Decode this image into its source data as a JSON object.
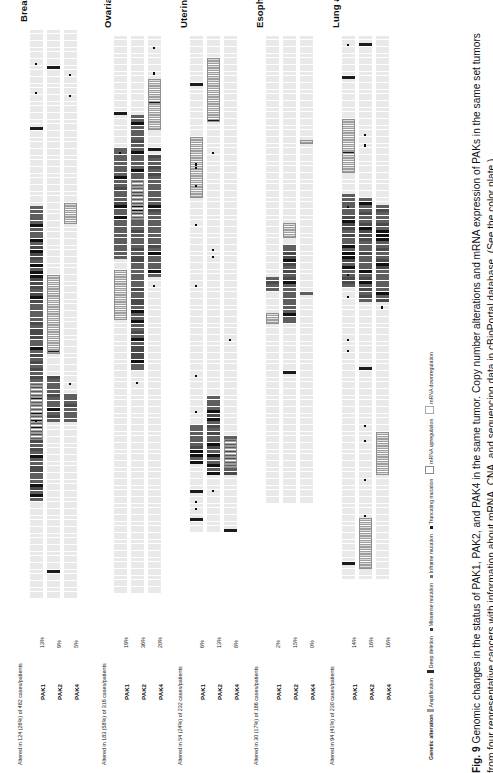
{
  "figure": {
    "number": "Fig. 9",
    "caption_text": "Genomic changes in the status of PAK1, PAK2, and PAK4 in the same tumor. Copy number alterations and mRNA expression of PAKs in the same set tumors from four representative cancers with information about mRNA, CNA, and sequencing data in cBioPortal database. (See the color plate.)"
  },
  "legend": {
    "title": "Genetic alteration",
    "items": [
      {
        "key": "amplification",
        "label": "Amplification",
        "swatch": "lg-amp",
        "color": "#9a9a9a"
      },
      {
        "key": "deep-deletion",
        "label": "Deep deletion",
        "swatch": "lg-del",
        "color": "#2b2b2b"
      },
      {
        "key": "missense-mutation",
        "label": "Missense mutation",
        "swatch": "lg-mis",
        "color": "#3a3a3a"
      },
      {
        "key": "inframe-mutation",
        "label": "Inframe mutation",
        "swatch": "lg-inf",
        "color": "#6d6d6d"
      },
      {
        "key": "truncating-mutation",
        "label": "Truncating mutation",
        "swatch": "lg-tru",
        "color": "#151515"
      },
      {
        "key": "mrna-upregulation",
        "label": "mRNA upregulation",
        "swatch": "lg-up",
        "color": "#8a8a8a"
      },
      {
        "key": "mrna-downregulation",
        "label": "mRNA downregulation",
        "swatch": "lg-down",
        "color": "#a8a8a8"
      }
    ]
  },
  "panels": [
    {
      "id": "breast-invasive-carcinoma",
      "title": "Breast invasive carcinoma",
      "altered_line": "Altered in 124 (26%) of 482 cases/patients",
      "genes": [
        {
          "name": "PAK1",
          "percent": "13%"
        },
        {
          "name": "PAK2",
          "percent": "9%"
        },
        {
          "name": "PAK4",
          "percent": "5%"
        }
      ]
    },
    {
      "id": "ovarian-serous-cystadenocarcinoma",
      "title": "Ovarian serous cystadenocarcinoma",
      "altered_line": "Altered in 183 (58%) of 316 cases/patients",
      "genes": [
        {
          "name": "PAK1",
          "percent": "19%"
        },
        {
          "name": "PAK2",
          "percent": "36%"
        },
        {
          "name": "PAK4",
          "percent": "20%"
        }
      ]
    },
    {
      "id": "uterine-corpus-endometrioid-carcinoma",
      "title": "Uterine corpus endometrioid carcinoma",
      "altered_line": "Altered in 54 (24%) of 232 cases/patients",
      "genes": [
        {
          "name": "PAK1",
          "percent": "6%"
        },
        {
          "name": "PAK2",
          "percent": "13%"
        },
        {
          "name": "PAK4",
          "percent": "8%"
        }
      ]
    },
    {
      "id": "esophageal-carcinoma",
      "title": "Esophageal carcinoma",
      "altered_line": "Altered in 30 (17%) of 186 cases/patients",
      "genes": [
        {
          "name": "PAK1",
          "percent": "2%"
        },
        {
          "name": "PAK2",
          "percent": "15%"
        },
        {
          "name": "PAK4",
          "percent": "0%"
        }
      ]
    },
    {
      "id": "lung-adenocarcinoma",
      "title": "Lung adenocarcinoma",
      "altered_line": "Altered in 94 (41%) of 230 cases/patients",
      "genes": [
        {
          "name": "PAK1",
          "percent": "14%"
        },
        {
          "name": "PAK2",
          "percent": "16%"
        },
        {
          "name": "PAK4",
          "percent": "16%"
        }
      ]
    }
  ],
  "chart_data": {
    "type": "heatmap",
    "title": "Genomic changes in the status of PAK1, PAK2, and PAK4 in the same tumor",
    "xlabel": "Cases / patients (one cell per case)",
    "ylabel": "Gene",
    "legend_position": "bottom",
    "grid": false,
    "categories": [
      "PAK1",
      "PAK2",
      "PAK4"
    ],
    "series": [
      {
        "name": "Breast invasive carcinoma",
        "n_cases": 482,
        "altered_cases": 124,
        "altered_percent": 26,
        "values": [
          13,
          9,
          5
        ]
      },
      {
        "name": "Ovarian serous cystadenocarcinoma",
        "n_cases": 316,
        "altered_cases": 183,
        "altered_percent": 58,
        "values": [
          19,
          36,
          20
        ]
      },
      {
        "name": "Uterine corpus endometrioid carcinoma",
        "n_cases": 232,
        "altered_cases": 54,
        "altered_percent": 24,
        "values": [
          6,
          13,
          8
        ]
      },
      {
        "name": "Esophageal carcinoma",
        "n_cases": 186,
        "altered_cases": 30,
        "altered_percent": 17,
        "values": [
          2,
          15,
          0
        ]
      },
      {
        "name": "Lung adenocarcinoma",
        "n_cases": 230,
        "altered_cases": 94,
        "altered_percent": 41,
        "values": [
          14,
          16,
          16
        ]
      }
    ]
  },
  "render": {
    "panel_layout": [
      {
        "x": 16,
        "track_len": 572,
        "track_top": 30,
        "seed": 11
      },
      {
        "x": 100,
        "track_len": 560,
        "track_top": 36,
        "seed": 27
      },
      {
        "x": 176,
        "track_len": 500,
        "track_top": 36,
        "seed": 43
      },
      {
        "x": 252,
        "track_len": 470,
        "track_top": 36,
        "seed": 61
      },
      {
        "x": 328,
        "track_len": 545,
        "track_top": 36,
        "seed": 83
      }
    ],
    "alteration_rates": [
      [
        {
          "amp": 0.52,
          "del": 0.02,
          "up": 0.1,
          "mut": 0.02
        },
        {
          "amp": 0.08,
          "del": 0.01,
          "up": 0.14,
          "mut": 0.01
        },
        {
          "amp": 0.05,
          "del": 0.0,
          "up": 0.04,
          "mut": 0.01
        }
      ],
      [
        {
          "amp": 0.2,
          "del": 0.01,
          "up": 0.09,
          "mut": 0.01
        },
        {
          "amp": 0.46,
          "del": 0.01,
          "up": 0.07,
          "mut": 0.01
        },
        {
          "amp": 0.22,
          "del": 0.01,
          "up": 0.09,
          "mut": 0.01
        }
      ],
      [
        {
          "amp": 0.08,
          "del": 0.02,
          "up": 0.12,
          "mut": 0.03
        },
        {
          "amp": 0.16,
          "del": 0.02,
          "up": 0.13,
          "mut": 0.03
        },
        {
          "amp": 0.08,
          "del": 0.01,
          "up": 0.06,
          "mut": 0.01
        }
      ],
      [
        {
          "amp": 0.03,
          "del": 0.0,
          "up": 0.02,
          "mut": 0.0
        },
        {
          "amp": 0.17,
          "del": 0.01,
          "up": 0.03,
          "mut": 0.0
        },
        {
          "amp": 0.01,
          "del": 0.0,
          "up": 0.01,
          "mut": 0.0
        }
      ],
      [
        {
          "amp": 0.17,
          "del": 0.02,
          "up": 0.1,
          "mut": 0.03
        },
        {
          "amp": 0.19,
          "del": 0.01,
          "up": 0.09,
          "mut": 0.02
        },
        {
          "amp": 0.18,
          "del": 0.01,
          "up": 0.08,
          "mut": 0.01
        }
      ]
    ]
  }
}
